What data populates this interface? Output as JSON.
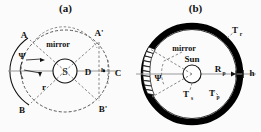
{
  "figure": {
    "panels": [
      {
        "id": "a",
        "title": "(a)",
        "labels": {
          "a_top_left": "A",
          "a_top_right": "A'",
          "b_bottom_left": "B",
          "b_bottom_right": "B'",
          "center": "S",
          "mirror": "mirror",
          "radius": "r",
          "distance": "D",
          "height": "h",
          "collector": "C",
          "angle": "Ψ"
        }
      },
      {
        "id": "b",
        "title": "(b)",
        "labels": {
          "mirror": "mirror",
          "sun": "Sun",
          "angle": "Ψ",
          "radius_p": "R",
          "radius_p_sub": "p",
          "thickness": "h",
          "temp_r": "T",
          "temp_r_sub": "r",
          "temp_s": "T",
          "temp_s_sub": "s",
          "temp_p": "T",
          "temp_p_sub": "p"
        }
      }
    ],
    "colors": {
      "ink": "#111111",
      "ring_fill": "#000000",
      "dashed": "#555555",
      "background": "#fbfbfb"
    }
  }
}
